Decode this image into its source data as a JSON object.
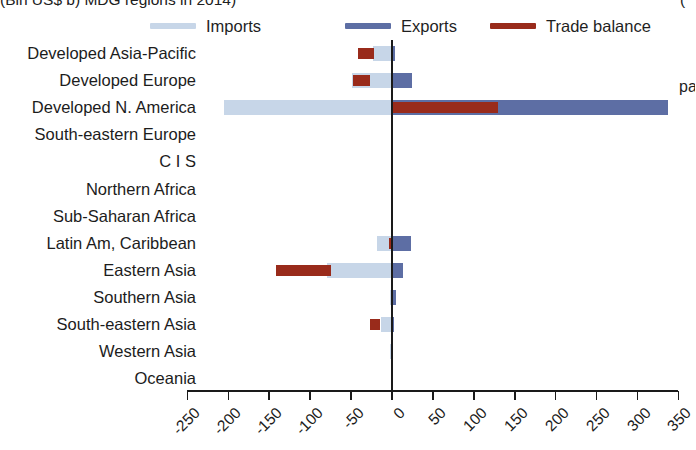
{
  "title": {
    "left_clipped": "(Bln US$ b) MDG regions in 2014)",
    "right_clipped": "(",
    "side_fragment": "pa"
  },
  "legend": {
    "position": "top",
    "items": [
      {
        "label": "Imports",
        "color": "#c7d6e8",
        "icon": "line-swatch-icon"
      },
      {
        "label": "Exports",
        "color": "#5d6ea4",
        "icon": "line-swatch-icon"
      },
      {
        "label": "Trade balance",
        "color": "#992b1b",
        "icon": "line-swatch-icon"
      }
    ]
  },
  "chart_data": {
    "type": "bar",
    "orientation": "horizontal",
    "title": "(Bln US$ b) MDG regions in 2014)",
    "xlabel": "",
    "ylabel": "",
    "xlim": [
      -250,
      350
    ],
    "xticks": [
      -250,
      -200,
      -150,
      -100,
      -50,
      0,
      50,
      100,
      150,
      200,
      250,
      300,
      350
    ],
    "xticklabels": [
      "-250",
      "-200",
      "-150",
      "-100",
      "-50",
      "0",
      "50",
      "100",
      "150",
      "200",
      "250",
      "300",
      "350"
    ],
    "grid": false,
    "zero_line": 0,
    "categories": [
      "Developed Asia-Pacific",
      "Developed Europe",
      "Developed N. America",
      "South-eastern Europe",
      "C I S",
      "Northern Africa",
      "Sub-Saharan Africa",
      "Latin Am, Caribbean",
      "Eastern Asia",
      "Southern Asia",
      "South-eastern Asia",
      "Western Asia",
      "Oceania"
    ],
    "series": [
      {
        "name": "Imports",
        "color": "#c7d6e8",
        "values": [
          -23,
          -49,
          -205,
          0,
          0,
          0,
          0,
          -18,
          -80,
          -3,
          -14,
          -2,
          0
        ]
      },
      {
        "name": "Exports",
        "color": "#5d6ea4",
        "values": [
          4,
          24,
          337,
          0,
          0,
          0,
          0,
          23,
          13,
          5,
          2,
          1,
          0
        ]
      },
      {
        "name": "Trade balance",
        "color": "#992b1b",
        "values": [
          -19,
          -21,
          129,
          0,
          0,
          0,
          0,
          5,
          -67,
          2,
          -12,
          0,
          0
        ]
      }
    ],
    "balance_starts": [
      -22,
      -27,
      0,
      0,
      0,
      0,
      0,
      -4,
      -75,
      -1,
      -15,
      -1,
      0
    ]
  }
}
